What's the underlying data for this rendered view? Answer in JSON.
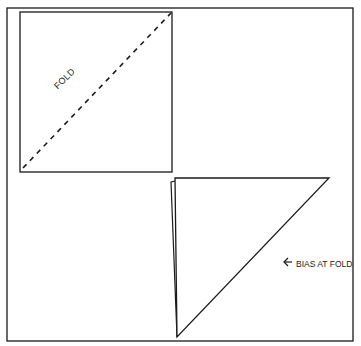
{
  "diagram": {
    "labels": {
      "fold": "FOLD",
      "bias": "BIAS AT FOLD"
    },
    "colors": {
      "line": "#1a1a1a",
      "background": "#ffffff"
    },
    "shapes": {
      "frame": {
        "x1": 7,
        "y1": 8,
        "x2": 353,
        "y2": 341
      },
      "square": {
        "x1": 20,
        "y1": 12,
        "x2": 172,
        "y2": 172
      },
      "fold_line": {
        "from": [
          22,
          168
        ],
        "to": [
          171,
          13
        ],
        "style": "dashed"
      },
      "folded_triangle": {
        "points": [
          [
            175,
            178
          ],
          [
            329,
            178
          ],
          [
            177,
            337
          ]
        ]
      },
      "back_layer_edge": {
        "points": [
          [
            171,
            182
          ],
          [
            175,
            182
          ],
          [
            177,
            337
          ]
        ]
      },
      "arrow": {
        "from": [
          292,
          262
        ],
        "to": [
          282,
          262
        ]
      }
    }
  }
}
